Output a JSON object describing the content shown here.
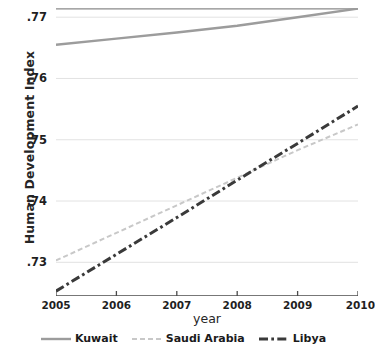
{
  "chart_data": {
    "type": "line",
    "title": "",
    "xlabel": "year",
    "ylabel": "Human Development Index",
    "x": [
      2005,
      2006,
      2007,
      2008,
      2009,
      2010
    ],
    "xlim": [
      2005,
      2010
    ],
    "ylim": [
      0.7245,
      0.7715
    ],
    "grid": true,
    "legend_position": "bottom",
    "xticklabels": [
      "2005",
      "2006",
      "2007",
      "2008",
      "2009",
      "2010"
    ],
    "xtick_last_clipped": "2010",
    "yticks": [
      0.73,
      0.74,
      0.75,
      0.76,
      0.77
    ],
    "yticklabels": [
      ".73",
      ".74",
      ".75",
      ".76",
      ".77"
    ],
    "series": [
      {
        "name": "Kuwait",
        "color": "#9c9c9c",
        "style": "solid",
        "values": [
          0.7655,
          0.7665,
          0.7675,
          0.7686,
          0.77,
          0.7714
        ]
      },
      {
        "name": "Saudi Arabia",
        "color": "#c8c8c8",
        "style": "dashed",
        "values": [
          0.7303,
          0.7348,
          0.7393,
          0.7438,
          0.7483,
          0.7525
        ]
      },
      {
        "name": "Libya",
        "color": "#3a3a3a",
        "style": "dashdot",
        "values": [
          0.7253,
          0.7313,
          0.7373,
          0.7434,
          0.7494,
          0.7555
        ]
      }
    ]
  },
  "legend": {
    "items": [
      {
        "label": "Kuwait"
      },
      {
        "label": "Saudi Arabia"
      },
      {
        "label": "Libya"
      }
    ]
  }
}
